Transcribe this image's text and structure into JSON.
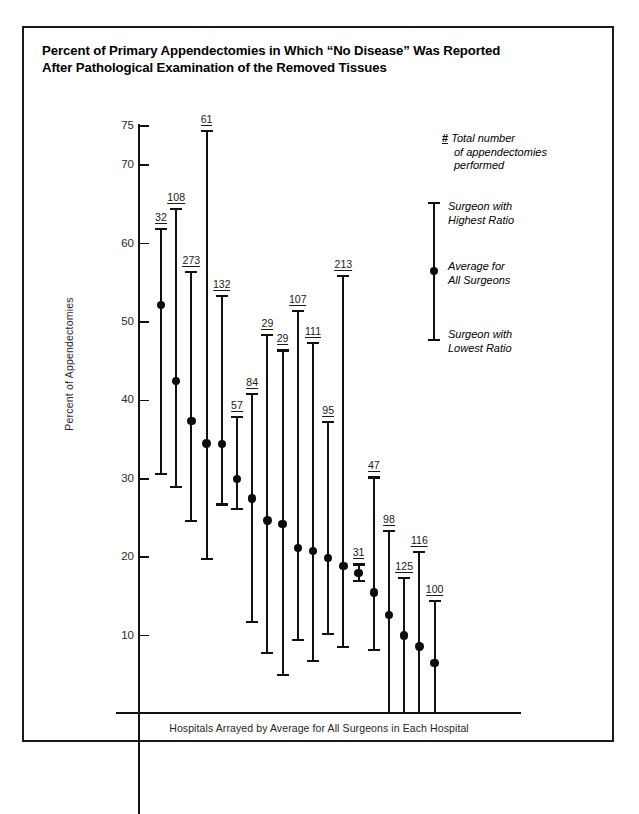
{
  "title": {
    "line1": "Percent of Primary Appendectomies in Which “No Disease” Was Reported",
    "line2": "After Pathological Examination of the Removed Tissues"
  },
  "legend": {
    "hash_symbol": "#",
    "hash_text_line1": "Total number",
    "hash_text_line2": "of appendectomies",
    "hash_text_line3": "performed",
    "high_line1": "Surgeon with",
    "high_line2": "Highest Ratio",
    "avg_line1": "Average for",
    "avg_line2": "All Surgeons",
    "low_line1": "Surgeon with",
    "low_line2": "Lowest Ratio"
  },
  "chart_data": {
    "type": "bar",
    "title": "Percent of Primary Appendectomies in Which “No Disease” Was Reported After Pathological Examination of the Removed Tissues",
    "xlabel": "Hospitals Arrayed by Average for All Surgeons in Each Hospital",
    "ylabel": "Percent of Appendectomies",
    "ylim": [
      0,
      75
    ],
    "yticks": [
      10,
      20,
      30,
      40,
      50,
      60,
      70,
      75
    ],
    "ytick_labels": [
      "10",
      "20",
      "30",
      "40",
      "50",
      "60",
      "70",
      "75"
    ],
    "grid": false,
    "legend_position": "right",
    "value_label_note": "# = Total number of appendectomies performed",
    "series": [
      {
        "name": "Surgeon with Highest Ratio",
        "key": "high"
      },
      {
        "name": "Average for All Surgeons",
        "key": "avg"
      },
      {
        "name": "Surgeon with Lowest Ratio",
        "key": "low"
      }
    ],
    "categories": [
      "32",
      "108",
      "273",
      "61",
      "132",
      "57",
      "84",
      "29",
      "29",
      "107",
      "111",
      "95",
      "213",
      "31",
      "47",
      "98",
      "125",
      "116",
      "100"
    ],
    "points": [
      {
        "n": "32",
        "high": 62.0,
        "avg": 52.2,
        "low": 30.5,
        "clipped_low": false
      },
      {
        "n": "108",
        "high": 64.5,
        "avg": 42.5,
        "low": 28.8,
        "clipped_low": false
      },
      {
        "n": "273",
        "high": 56.5,
        "avg": 37.4,
        "low": 24.5,
        "clipped_low": false
      },
      {
        "n": "61",
        "high": 74.5,
        "avg": 34.5,
        "low": 19.7,
        "clipped_low": false
      },
      {
        "n": "132",
        "high": 53.5,
        "avg": 34.4,
        "low": 26.6,
        "clipped_low": false
      },
      {
        "n": "57",
        "high": 38.0,
        "avg": 30.0,
        "low": 26.0,
        "clipped_low": false
      },
      {
        "n": "84",
        "high": 41.0,
        "avg": 27.5,
        "low": 11.6,
        "clipped_low": false
      },
      {
        "n": "29",
        "high": 48.5,
        "avg": 24.7,
        "low": 7.7,
        "clipped_low": false
      },
      {
        "n": "29",
        "high": 46.5,
        "avg": 24.2,
        "low": 4.9,
        "clipped_low": false
      },
      {
        "n": "107",
        "high": 51.5,
        "avg": 21.2,
        "low": 9.3,
        "clipped_low": false
      },
      {
        "n": "111",
        "high": 47.5,
        "avg": 20.8,
        "low": 6.6,
        "clipped_low": false
      },
      {
        "n": "95",
        "high": 37.4,
        "avg": 19.9,
        "low": 10.1,
        "clipped_low": false
      },
      {
        "n": "213",
        "high": 56.0,
        "avg": 18.9,
        "low": 8.4,
        "clipped_low": false
      },
      {
        "n": "31",
        "high": 19.2,
        "avg": 18.0,
        "low": 16.8,
        "clipped_low": false
      },
      {
        "n": "47",
        "high": 30.3,
        "avg": 15.5,
        "low": 8.0,
        "clipped_low": false
      },
      {
        "n": "98",
        "high": 23.5,
        "avg": 12.6,
        "low": 0.0,
        "clipped_low": true
      },
      {
        "n": "125",
        "high": 17.5,
        "avg": 10.0,
        "low": 0.0,
        "clipped_low": true
      },
      {
        "n": "116",
        "high": 20.8,
        "avg": 8.6,
        "low": 0.0,
        "clipped_low": true
      },
      {
        "n": "100",
        "high": 14.5,
        "avg": 6.5,
        "low": 0.0,
        "clipped_low": true
      }
    ]
  }
}
